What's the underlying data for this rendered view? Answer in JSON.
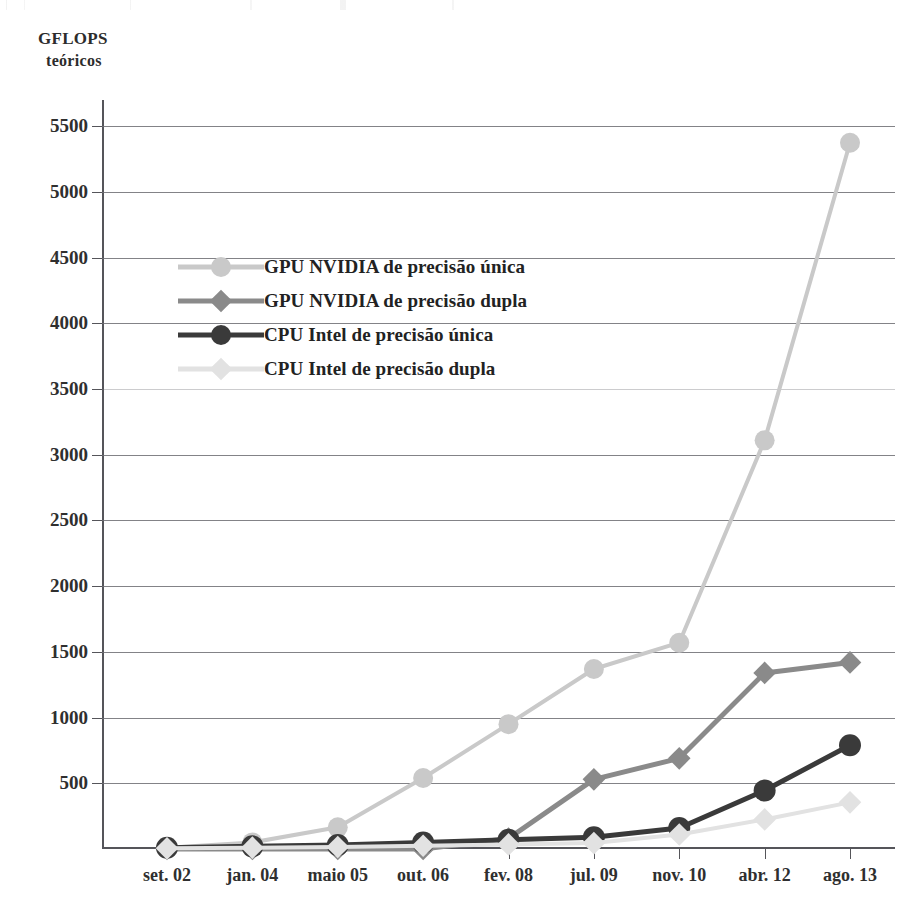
{
  "axis_title": {
    "line1": "GFLOPS",
    "line2": "teóricos"
  },
  "chart_data": {
    "type": "line",
    "title": "",
    "subtitle": "",
    "xlabel": "",
    "ylabel": "GFLOPS teóricos",
    "categories": [
      "set. 02",
      "jan. 04",
      "maio 05",
      "out. 06",
      "fev. 08",
      "jul. 09",
      "nov. 10",
      "abr. 12",
      "ago. 13"
    ],
    "yticks": [
      500,
      1000,
      1500,
      2000,
      2500,
      3000,
      3500,
      4000,
      4500,
      5000,
      5500
    ],
    "ytick_labels": [
      "500",
      "1000",
      "1500",
      "2000",
      "2500",
      "3000",
      "3500",
      "4000",
      "4500",
      "5000",
      "5500"
    ],
    "ylim": [
      0,
      5700
    ],
    "grid": true,
    "legend_position": "upper-left",
    "series": [
      {
        "name": "GPU NVIDIA de precisão única",
        "color": "#c9c9c9",
        "marker": "circle",
        "values": [
          10,
          50,
          165,
          540,
          950,
          1370,
          1570,
          3110,
          5375
        ]
      },
      {
        "name": "GPU NVIDIA de precisão dupla",
        "color": "#8a8a8a",
        "marker": "diamond",
        "values": [
          0,
          0,
          0,
          0,
          80,
          530,
          690,
          1340,
          1420
        ]
      },
      {
        "name": "CPU Intel de precisão única",
        "color": "#3a3a3a",
        "marker": "circle",
        "values": [
          10,
          20,
          30,
          50,
          70,
          90,
          160,
          445,
          790
        ]
      },
      {
        "name": "CPU Intel de precisão dupla",
        "color": "#e2e2e2",
        "marker": "diamond",
        "values": [
          5,
          10,
          15,
          25,
          35,
          45,
          110,
          225,
          355
        ]
      }
    ]
  },
  "legend": {
    "items": [
      {
        "label": "GPU NVIDIA de precisão única",
        "color": "#c9c9c9",
        "marker": "circle"
      },
      {
        "label": "GPU NVIDIA de precisão dupla",
        "color": "#8a8a8a",
        "marker": "diamond"
      },
      {
        "label": "CPU Intel de precisão única",
        "color": "#3a3a3a",
        "marker": "circle"
      },
      {
        "label": "CPU Intel de precisão dupla",
        "color": "#e2e2e2",
        "marker": "diamond"
      }
    ]
  }
}
